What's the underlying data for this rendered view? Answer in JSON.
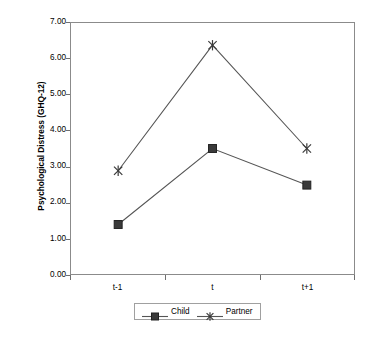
{
  "chart_data": {
    "type": "line",
    "title": "",
    "subtitle": "",
    "xlabel": "",
    "ylabel": "Psychological Distress (GHQ-12)",
    "categories": [
      "t-1",
      "t",
      "t+1"
    ],
    "series": [
      {
        "name": "Child",
        "marker": "square",
        "values": [
          1.38,
          3.5,
          2.48
        ]
      },
      {
        "name": "Partner",
        "marker": "asterisk",
        "values": [
          2.88,
          6.38,
          3.5
        ]
      }
    ],
    "ylim": [
      0.0,
      7.0
    ],
    "ytick_labels": [
      "7.00",
      "6.00",
      "5.00",
      "4.00",
      "3.00",
      "2.00",
      "1.00",
      "0.00"
    ],
    "ytick_values": [
      7,
      6,
      5,
      4,
      3,
      2,
      1,
      0
    ],
    "grid": false,
    "legend_position": "bottom-center",
    "plot_border": true,
    "line_color": "#4d4d4d",
    "marker_color": "#333333"
  },
  "axes": {
    "y_title": "Psychological Distress (GHQ-12)",
    "y_ticks": [
      "7.00",
      "6.00",
      "5.00",
      "4.00",
      "3.00",
      "2.00",
      "1.00",
      "0.00"
    ],
    "x_ticks": [
      "t-1",
      "t",
      "t+1"
    ]
  },
  "legend": {
    "entries": [
      {
        "label": "Child"
      },
      {
        "label": "Partner"
      }
    ]
  }
}
